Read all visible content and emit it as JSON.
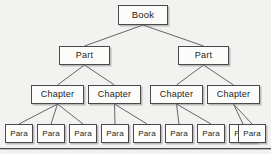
{
  "diagram": {
    "type": "tree-hierarchy",
    "background_color": "#f2f2f0",
    "node_fill_color": "#fcfcfa",
    "node_border_color": "#4a4a4a",
    "edge_color": "#555555",
    "levels": [
      {
        "name": "book",
        "label_text": "Book",
        "count": 1
      },
      {
        "name": "part",
        "label_text": "Part",
        "count": 2
      },
      {
        "name": "chapter",
        "label_text": "Chapter",
        "count": 4
      },
      {
        "name": "para",
        "label_text": "Para",
        "count": 9
      }
    ],
    "nodes": [
      {
        "id": "book",
        "label": "Book",
        "level": "book",
        "x": 118,
        "y": 5,
        "w": 50,
        "h": 20
      },
      {
        "id": "part-1",
        "label": "Part",
        "level": "part",
        "x": 59,
        "y": 46,
        "w": 51,
        "h": 19
      },
      {
        "id": "part-2",
        "label": "Part",
        "level": "part",
        "x": 178,
        "y": 46,
        "w": 51,
        "h": 19
      },
      {
        "id": "chapter-1",
        "label": "Chapter",
        "level": "chapter",
        "x": 31,
        "y": 85,
        "w": 53,
        "h": 19
      },
      {
        "id": "chapter-2",
        "label": "Chapter",
        "level": "chapter",
        "x": 88,
        "y": 85,
        "w": 53,
        "h": 19
      },
      {
        "id": "chapter-3",
        "label": "Chapter",
        "level": "chapter",
        "x": 150,
        "y": 85,
        "w": 53,
        "h": 19
      },
      {
        "id": "chapter-4",
        "label": "Chapter",
        "level": "chapter",
        "x": 207,
        "y": 85,
        "w": 53,
        "h": 19
      },
      {
        "id": "para-1",
        "label": "Para",
        "level": "para",
        "x": 5,
        "y": 124,
        "w": 28,
        "h": 19
      },
      {
        "id": "para-2",
        "label": "Para",
        "level": "para",
        "x": 37,
        "y": 124,
        "w": 28,
        "h": 19
      },
      {
        "id": "para-3",
        "label": "Para",
        "level": "para",
        "x": 69,
        "y": 124,
        "w": 28,
        "h": 19
      },
      {
        "id": "para-4",
        "label": "Para",
        "level": "para",
        "x": 101,
        "y": 124,
        "w": 28,
        "h": 19
      },
      {
        "id": "para-5",
        "label": "Para",
        "level": "para",
        "x": 133,
        "y": 124,
        "w": 28,
        "h": 19
      },
      {
        "id": "para-6",
        "label": "Para",
        "level": "para",
        "x": 165,
        "y": 124,
        "w": 28,
        "h": 19
      },
      {
        "id": "para-7",
        "label": "Para",
        "level": "para",
        "x": 197,
        "y": 124,
        "w": 28,
        "h": 19
      },
      {
        "id": "para-8",
        "label": "Para",
        "level": "para",
        "x": 229,
        "y": 124,
        "w": 28,
        "h": 19
      },
      {
        "id": "para-9",
        "label": "Para",
        "level": "para",
        "x": 238,
        "y": 124,
        "w": 28,
        "h": 19
      }
    ],
    "edges": [
      {
        "from": "book",
        "to": "part-1"
      },
      {
        "from": "book",
        "to": "part-2"
      },
      {
        "from": "part-1",
        "to": "chapter-1"
      },
      {
        "from": "part-1",
        "to": "chapter-2"
      },
      {
        "from": "part-2",
        "to": "chapter-3"
      },
      {
        "from": "part-2",
        "to": "chapter-4"
      },
      {
        "from": "chapter-1",
        "to": "para-1"
      },
      {
        "from": "chapter-1",
        "to": "para-2"
      },
      {
        "from": "chapter-1",
        "to": "para-3"
      },
      {
        "from": "chapter-2",
        "to": "para-4"
      },
      {
        "from": "chapter-2",
        "to": "para-5"
      },
      {
        "from": "chapter-3",
        "to": "para-6"
      },
      {
        "from": "chapter-3",
        "to": "para-7"
      },
      {
        "from": "chapter-4",
        "to": "para-8"
      },
      {
        "from": "chapter-4",
        "to": "para-9"
      }
    ],
    "baseline_rule": {
      "y": 148
    }
  }
}
